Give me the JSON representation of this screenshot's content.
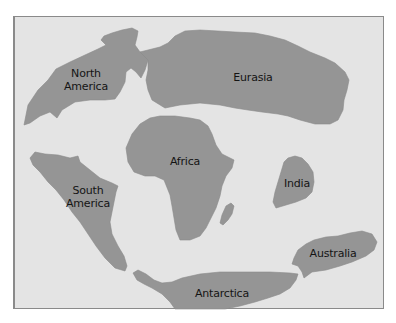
{
  "map": {
    "type": "world-map-continents",
    "colors": {
      "ocean": "#e4e4e4",
      "land": "#959595",
      "border": "#8a8a8a",
      "label": "#141414"
    },
    "regions": [
      {
        "id": "north-america",
        "label": "North\nAmerica",
        "x": 85,
        "y": 80
      },
      {
        "id": "eurasia",
        "label": "Eurasia",
        "x": 252,
        "y": 77
      },
      {
        "id": "africa",
        "label": "Africa",
        "x": 185,
        "y": 161
      },
      {
        "id": "south-america",
        "label": "South\nAmerica",
        "x": 88,
        "y": 197
      },
      {
        "id": "india",
        "label": "India",
        "x": 297,
        "y": 183
      },
      {
        "id": "australia",
        "label": "Australia",
        "x": 333,
        "y": 253
      },
      {
        "id": "antarctica",
        "label": "Antarctica",
        "x": 222,
        "y": 293
      },
      {
        "id": "madagascar",
        "label": "",
        "x": 228,
        "y": 214
      }
    ]
  }
}
